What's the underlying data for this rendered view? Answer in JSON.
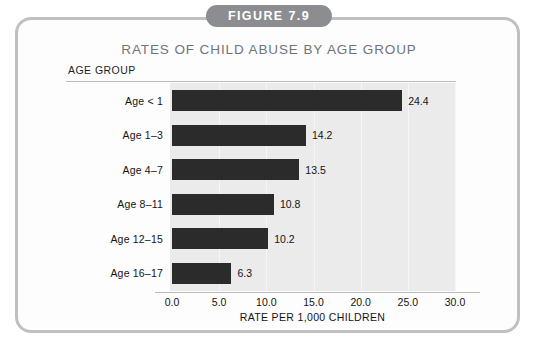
{
  "figure": {
    "badge_label": "FIGURE 7.9",
    "title": "RATES OF CHILD ABUSE BY AGE GROUP",
    "category_axis_header": "AGE GROUP"
  },
  "colors": {
    "badge_background": "#8b8d90",
    "badge_text": "#ffffff",
    "title_text": "#6f7478",
    "bar": "#2b2b2b",
    "plot_background": "#ebebeb",
    "frame_border": "#bfc0c2",
    "gridline": "#f6f6f6",
    "axis_line": "#b9babc"
  },
  "chart_data": {
    "type": "bar",
    "orientation": "horizontal",
    "title": "RATES OF CHILD ABUSE BY AGE GROUP",
    "xlabel": "RATE PER 1,000 CHILDREN",
    "ylabel": "AGE GROUP",
    "categories": [
      "Age < 1",
      "Age 1–3",
      "Age 4–7",
      "Age 8–11",
      "Age 12–15",
      "Age 16–17"
    ],
    "values": [
      24.4,
      14.2,
      13.5,
      10.8,
      10.2,
      6.3
    ],
    "value_labels": [
      "24.4",
      "14.2",
      "13.5",
      "10.8",
      "10.2",
      "6.3"
    ],
    "xlim": [
      0.0,
      30.0
    ],
    "xticks": [
      0.0,
      5.0,
      10.0,
      15.0,
      20.0,
      25.0,
      30.0
    ],
    "xtick_labels": [
      "0.0",
      "5.0",
      "10.0",
      "15.0",
      "20.0",
      "25.0",
      "30.0"
    ],
    "grid": true,
    "legend": null
  }
}
